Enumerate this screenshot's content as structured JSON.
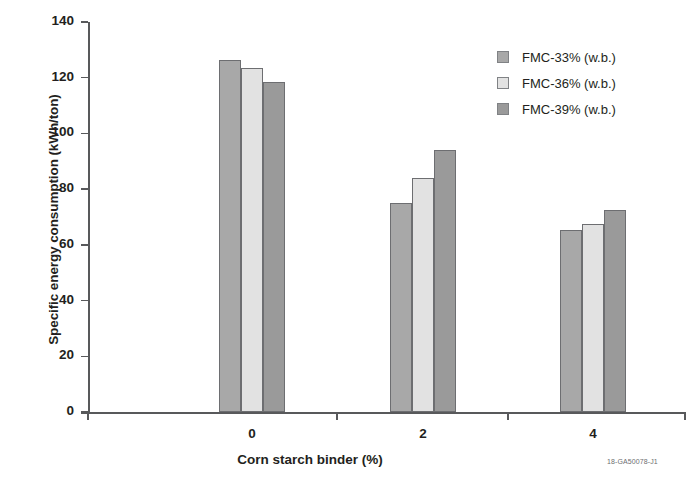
{
  "corner_id": "18-GA50078-J1",
  "legend": {
    "position": "top-right",
    "entries": [
      {
        "label": "FMC-33% (w.b.)",
        "color": "#a8a8a8"
      },
      {
        "label": "FMC-36% (w.b.)",
        "color": "#e2e2e2"
      },
      {
        "label": "FMC-39% (w.b.)",
        "color": "#9a9a9a"
      }
    ]
  },
  "chart_data": {
    "type": "bar",
    "title": "",
    "xlabel": "Corn starch binder (%)",
    "ylabel": "Specific energy consumption (kWh/ton)",
    "categories": [
      "0",
      "2",
      "4"
    ],
    "series": [
      {
        "name": "FMC-33% (w.b.)",
        "color": "#a8a8a8",
        "values": [
          126.5,
          75.0,
          65.5
        ]
      },
      {
        "name": "FMC-36% (w.b.)",
        "color": "#e2e2e2",
        "values": [
          123.5,
          84.0,
          67.5
        ]
      },
      {
        "name": "FMC-39% (w.b.)",
        "color": "#9a9a9a",
        "values": [
          118.5,
          94.0,
          72.5
        ]
      }
    ],
    "ylim": [
      0,
      140
    ],
    "yticks": [
      0,
      20,
      40,
      60,
      80,
      100,
      120,
      140
    ],
    "ytick_labels": [
      "0",
      "20",
      "40",
      "60",
      "80",
      "100",
      "120",
      "140"
    ],
    "grid": false,
    "legend_position": "top-right"
  }
}
